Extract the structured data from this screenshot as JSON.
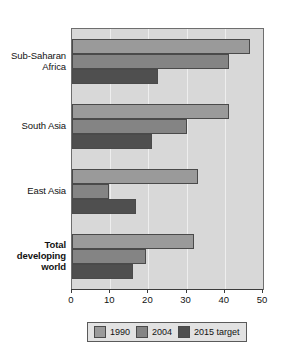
{
  "chart_data": {
    "type": "bar",
    "orientation": "horizontal",
    "title": "",
    "subtitle": "",
    "xlabel": "",
    "ylabel": "",
    "xlim": [
      0,
      50
    ],
    "xticks": [
      0,
      10,
      20,
      30,
      40,
      50
    ],
    "xtick_labels": [
      "0",
      "10",
      "20",
      "30",
      "40",
      "50"
    ],
    "grid": true,
    "grid_axis": "x",
    "legend_position": "bottom",
    "categories": [
      "Sub-Saharan Africa",
      "South Asia",
      "East Asia",
      "Total developing world"
    ],
    "series": [
      {
        "name": "1990",
        "color": "#9a9a9a",
        "values": [
          46.5,
          41,
          33,
          32
        ]
      },
      {
        "name": "2004",
        "color": "#848484",
        "values": [
          41,
          30,
          9.7,
          19.5
        ]
      },
      {
        "name": "2015 target",
        "color": "#4f4f4f",
        "values": [
          22.5,
          21,
          16.8,
          16
        ]
      }
    ]
  },
  "category_axis": {
    "labels": [
      {
        "text": "Sub-Saharan\nAfrica",
        "bold": false
      },
      {
        "text": "South Asia",
        "bold": false
      },
      {
        "text": "East Asia",
        "bold": false
      },
      {
        "text": "Total\ndeveloping\nworld",
        "bold": true
      }
    ]
  },
  "legend": {
    "items": [
      {
        "label": "1990",
        "color": "#9a9a9a"
      },
      {
        "label": "2004",
        "color": "#848484"
      },
      {
        "label": "2015 target",
        "color": "#4f4f4f"
      }
    ]
  },
  "colors": {
    "plot_background": "#d8d8d8",
    "plot_border": "#6e6e6e",
    "gridline": "#eeeeee",
    "bar_border": "#4a4a4a",
    "axis": "#3c3c3c",
    "text": "#121212",
    "legend_background": "#e2e2e2",
    "legend_border": "#5a5a5a",
    "page_background": "#ffffff"
  }
}
